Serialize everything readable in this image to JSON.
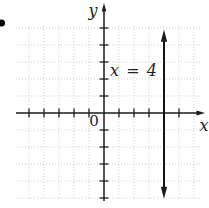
{
  "figure": {
    "bullet_present": true,
    "labels": {
      "y_axis": "y",
      "x_axis": "x",
      "origin": "0",
      "equation": "x = 4"
    }
  },
  "colors": {
    "background": "#ffffff",
    "axis": "#1c1c1c",
    "graph_line": "#111111",
    "grid": "#cfcfc6",
    "text": "#1f1f1f"
  },
  "chart_data": {
    "type": "line",
    "equation": "x = 4",
    "xlabel": "x",
    "ylabel": "y",
    "origin_label": "0",
    "xlim": [
      -5.9,
      6.7
    ],
    "ylim": [
      -5.2,
      6.5
    ],
    "units_per_grid_square": 1,
    "grid": true,
    "legend": false,
    "x_ticks": [
      -5,
      -4,
      -3,
      -2,
      -1,
      1,
      2,
      3,
      4,
      5
    ],
    "y_ticks": [
      -5,
      -4,
      -3,
      -2,
      -1,
      1,
      2,
      3,
      4,
      5
    ],
    "series": [
      {
        "name": "x = 4",
        "orientation": "vertical",
        "x": 4,
        "y_extent": [
          -5.05,
          4.9
        ],
        "arrows": "both"
      }
    ],
    "annotation": {
      "text": "x = 4",
      "x": 2.0,
      "y": 2.4
    }
  }
}
